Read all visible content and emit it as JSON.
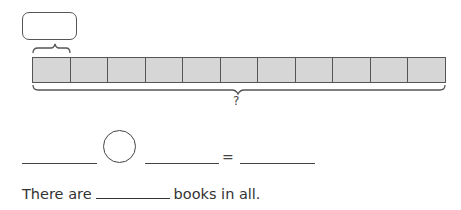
{
  "diagram": {
    "type": "bar-model",
    "answer_box": {
      "value": ""
    },
    "bar": {
      "cell_count": 11,
      "cell_color": "#d6d6d6",
      "border_color": "#555555"
    },
    "total_label": "?"
  },
  "equation": {
    "first_blank": "",
    "operator": "",
    "second_blank": "",
    "equals_sign": "=",
    "result_blank": ""
  },
  "sentence": {
    "prefix": "There are",
    "blank": "",
    "suffix": "books in all."
  }
}
